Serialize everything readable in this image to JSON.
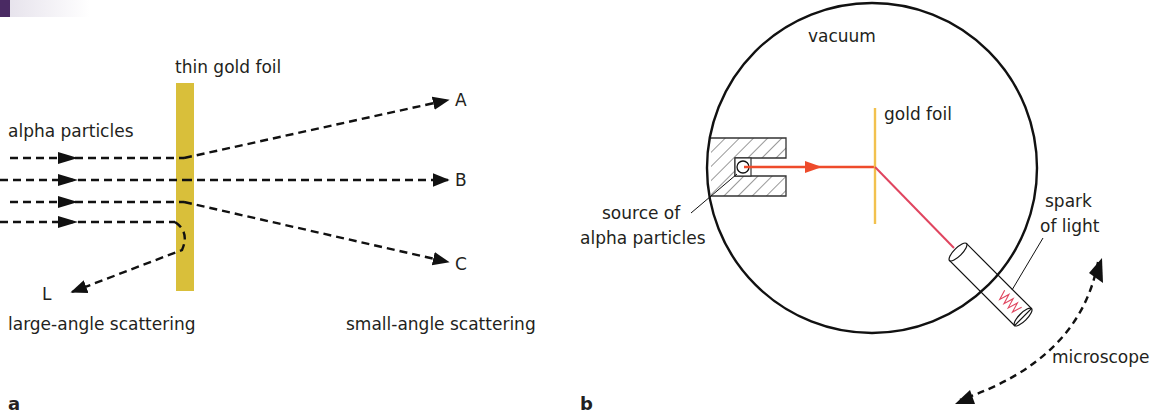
{
  "header": {
    "accent_color": "#4a2a63"
  },
  "panel_a": {
    "panel_label": "a",
    "foil_label": "thin gold foil",
    "incoming_label": "alpha particles",
    "path_labels": {
      "A": "A",
      "B": "B",
      "C": "C",
      "L": "L"
    },
    "large_angle_label": "large-angle scattering",
    "small_angle_label": "small-angle scattering",
    "foil_color": "#d9bf3a"
  },
  "panel_b": {
    "panel_label": "b",
    "chamber_label": "vacuum",
    "foil_label": "gold foil",
    "source_label_line1": "source of",
    "source_label_line2": "alpha particles",
    "spark_label_line1": "spark",
    "spark_label_line2": "of light",
    "detector_label": "microscope",
    "beam_color": "#ee4b2b",
    "scattered_color": "#e0455f",
    "foil_color": "#f2c14e"
  }
}
